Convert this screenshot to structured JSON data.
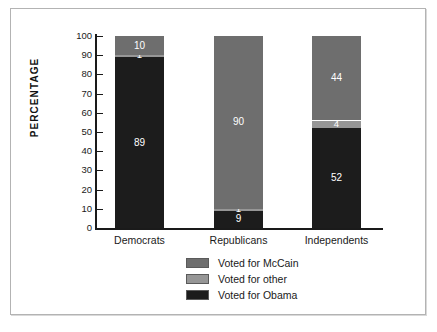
{
  "chart_data": {
    "type": "bar",
    "subtype": "stacked-bar-100-percent",
    "title": "",
    "xlabel": "",
    "ylabel": "PERCENTAGE",
    "ylim": [
      0,
      100
    ],
    "ytick_step": 10,
    "yticks": [
      100,
      90,
      80,
      70,
      60,
      50,
      40,
      30,
      20,
      10,
      0
    ],
    "ytick_labels": [
      "100",
      "90",
      "80",
      "70",
      "60",
      "50",
      "40",
      "30",
      "20",
      "10",
      "0"
    ],
    "grid": false,
    "legend_position": "bottom-center",
    "categories": [
      "Democrats",
      "Republicans",
      "Independents"
    ],
    "series": [
      {
        "name": "Voted for McCain",
        "color": "#6e6e6e",
        "values": [
          10,
          90,
          44
        ]
      },
      {
        "name": "Voted for other",
        "color": "#969696",
        "values": [
          1,
          1,
          4
        ]
      },
      {
        "name": "Voted for Obama",
        "color": "#1c1c1c",
        "values": [
          89,
          9,
          52
        ]
      }
    ],
    "stack_order_top_to_bottom": [
      "Voted for McCain",
      "Voted for other",
      "Voted for Obama"
    ],
    "data_labels": {
      "Democrats": {
        "Voted for McCain": "10",
        "Voted for other": "1",
        "Voted for Obama": "89"
      },
      "Republicans": {
        "Voted for McCain": "90",
        "Voted for other": "1",
        "Voted for Obama": "9"
      },
      "Independents": {
        "Voted for McCain": "44",
        "Voted for other": "4",
        "Voted for Obama": "52"
      }
    }
  },
  "legend": {
    "items": [
      {
        "label": "Voted for McCain",
        "color": "#6e6e6e"
      },
      {
        "label": "Voted for other",
        "color": "#969696"
      },
      {
        "label": "Voted for Obama",
        "color": "#1c1c1c"
      }
    ]
  },
  "axis": {
    "y_title": "PERCENTAGE"
  },
  "colors": {
    "axis": "#1a1a1a",
    "frame": "#b3b3b3",
    "background": "#ffffff",
    "label_text": "#ffffff"
  }
}
